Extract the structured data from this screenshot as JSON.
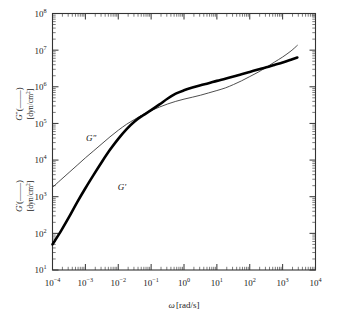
{
  "figure": {
    "background_color": "#ffffff",
    "frame_color": "#333333"
  },
  "chart_data": {
    "type": "line",
    "title": "",
    "subtitle": "",
    "xlabel": "ω[rad/s]",
    "ylabel_upper": "Gʺ(——) [dyn/cm²]",
    "ylabel_lower": "Gʹ(——) [dyn/cm²]",
    "xscale": "log",
    "yscale": "log",
    "xlim": [
      0.0001,
      10000
    ],
    "ylim": [
      10,
      100000000
    ],
    "grid": false,
    "legend_position": "inline-annotation",
    "x_tick_labels": [
      "10⁻⁴",
      "10⁻³",
      "10⁻²",
      "10⁻¹",
      "10⁰",
      "10¹",
      "10²",
      "10³",
      "10⁴"
    ],
    "x_tick_exponents": [
      "-4",
      "-3",
      "-2",
      "-1",
      "0",
      "1",
      "2",
      "3",
      "4"
    ],
    "x_tick_values": [
      0.0001,
      0.001,
      0.01,
      0.1,
      1,
      10,
      100,
      1000,
      10000
    ],
    "y_tick_labels": [
      "10¹",
      "10²",
      "10³",
      "10⁴",
      "10⁵",
      "10⁶",
      "10⁷",
      "10⁸"
    ],
    "y_tick_exponents": [
      "1",
      "2",
      "3",
      "4",
      "5",
      "6",
      "7",
      "8"
    ],
    "y_tick_values": [
      10,
      100,
      1000,
      10000,
      100000,
      1000000,
      10000000,
      100000000
    ],
    "series": [
      {
        "name": "Gʹ",
        "annotation": "Gʹ",
        "style": "thick-solid",
        "color": "#000000",
        "x": [
          0.0001,
          0.00018,
          0.00032,
          0.00056,
          0.001,
          0.0018,
          0.0032,
          0.0056,
          0.01,
          0.018,
          0.032,
          0.056,
          0.1,
          0.18,
          0.32,
          0.56,
          1,
          1.8,
          3.2,
          5.6,
          10,
          18,
          32,
          56,
          100,
          180,
          320,
          560,
          1000,
          1800,
          2800
        ],
        "y": [
          50,
          115,
          280,
          700,
          1700,
          4000,
          9000,
          19000,
          38000,
          70000,
          115000,
          165000,
          230000,
          330000,
          480000,
          650000,
          800000,
          950000,
          1100000,
          1250000,
          1450000,
          1650000,
          1900000,
          2200000,
          2550000,
          2950000,
          3400000,
          3950000,
          4600000,
          5500000,
          6300000
        ]
      },
      {
        "name": "Gʺ",
        "annotation": "Gʺ",
        "style": "thin-solid",
        "color": "#3a3a3a",
        "x": [
          0.0001,
          0.00018,
          0.00032,
          0.00056,
          0.001,
          0.0018,
          0.0032,
          0.0056,
          0.01,
          0.018,
          0.032,
          0.056,
          0.1,
          0.18,
          0.32,
          0.56,
          1,
          1.8,
          3.2,
          5.6,
          10,
          18,
          32,
          56,
          100,
          180,
          320,
          560,
          1000,
          1800,
          2800
        ],
        "y": [
          1800,
          2900,
          4600,
          7200,
          11500,
          18000,
          28000,
          43000,
          65000,
          95000,
          130000,
          175000,
          225000,
          280000,
          340000,
          400000,
          460000,
          520000,
          590000,
          680000,
          790000,
          930000,
          1150000,
          1450000,
          1900000,
          2500000,
          3400000,
          4700000,
          6500000,
          9500000,
          13500000
        ]
      }
    ],
    "annotations": [
      {
        "text": "Gʺ",
        "x": 0.0015,
        "y": 33000
      },
      {
        "text": "Gʹ",
        "x": 0.013,
        "y": 1500
      }
    ]
  }
}
